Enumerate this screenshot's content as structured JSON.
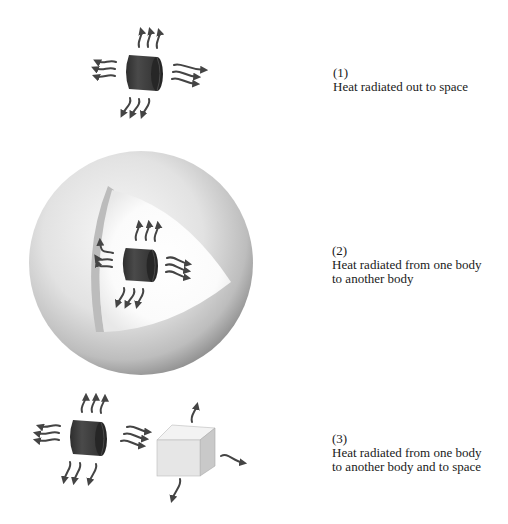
{
  "figure": {
    "panels": [
      {
        "number": "(1)",
        "lines": [
          "Heat radiated out to space"
        ],
        "scene": "single-body-radiating"
      },
      {
        "number": "(2)",
        "lines": [
          "Heat radiated from one body",
          "to another body"
        ],
        "scene": "body-inside-enclosing-sphere"
      },
      {
        "number": "(3)",
        "lines": [
          "Heat radiated from one body",
          "to another body and to space"
        ],
        "scene": "body-radiating-to-cube-and-space"
      }
    ],
    "icons": {
      "hot_body": "dark-cylinder",
      "enclosure": "cutaway-sphere",
      "second_body": "light-cube",
      "radiation": "wavy-arrow"
    },
    "colors": {
      "body": "#3b3b3b",
      "body_end": "#2a2a2a",
      "arrow": "#444444",
      "sphere_light": "#f2f2f2",
      "sphere_dark": "#9a9a9a",
      "cube_front": "#e6e6e6",
      "cube_top": "#f3f3f3",
      "cube_side": "#c9c9c9",
      "text": "#1a1a1a"
    }
  }
}
